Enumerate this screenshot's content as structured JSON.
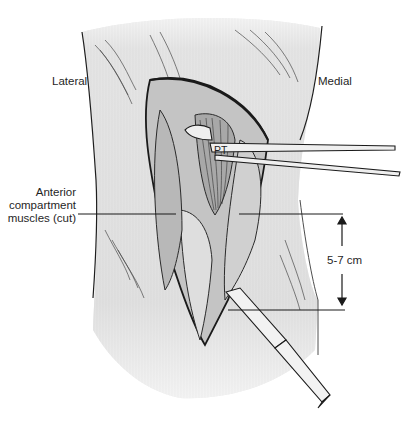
{
  "figure": {
    "type": "surgical-illustration",
    "colors": {
      "background": "#ffffff",
      "skin_shade": "#d9d9d9",
      "line": "#1e1e1e",
      "muscle": "#bdbdbd"
    }
  },
  "labels": {
    "lateral": "Lateral",
    "medial": "Medial",
    "pt": "PT",
    "anterior_line1": "Anterior",
    "anterior_line2": "compartment",
    "anterior_line3": "muscles (cut)",
    "measurement": "5-7 cm"
  },
  "annotations": {
    "measurement_range_cm": [
      5,
      7
    ],
    "leader_lines": [
      {
        "from": "anterior-compartment-label",
        "to": "cut-muscle-edge"
      },
      {
        "from": "top-measurement-line",
        "to": "incision-upper-point"
      },
      {
        "from": "bottom-measurement-line",
        "to": "scalpel-tip"
      }
    ]
  }
}
